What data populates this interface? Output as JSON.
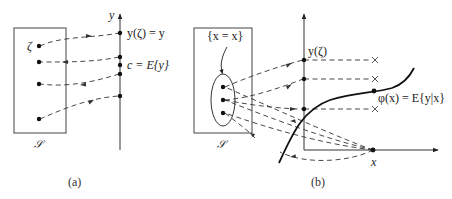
{
  "figure": {
    "panel_a": {
      "caption": "(a)",
      "sample_space_label": "𝒮",
      "outcome_label": "ζ",
      "axis_label": "y",
      "label_top": "y(ζ) = y",
      "label_mean": "c = E{y}"
    },
    "panel_b": {
      "caption": "(b)",
      "sample_space_label": "𝒮",
      "event_label": "{x = x}",
      "point_label_y": "y(ζ)",
      "curve_label": "φ(x) = E{y|x}",
      "x_label": "x"
    },
    "colors": {
      "ink": "#222222",
      "background": "#ffffff"
    }
  }
}
